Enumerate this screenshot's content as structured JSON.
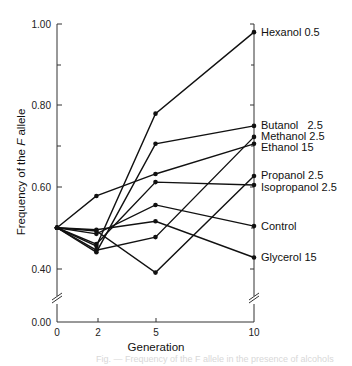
{
  "chart_data": {
    "type": "line",
    "title": "",
    "xlabel": "Generation",
    "ylabel": "Frequency of the F allele",
    "ylabel_parts": {
      "pre": "Frequency of the ",
      "italic": "F",
      "post": " allele"
    },
    "x": [
      0,
      2,
      5,
      10
    ],
    "x_tick_labels": [
      "0",
      "2",
      "5",
      "10"
    ],
    "y_tick_labels": [
      "0.00",
      "0.40",
      "0.60",
      "0.80",
      "1.00"
    ],
    "y_ticks": [
      0.0,
      0.4,
      0.5,
      0.6,
      0.7,
      0.8,
      0.9,
      1.0
    ],
    "ylim": [
      0.0,
      1.0
    ],
    "axis_break": true,
    "grid": false,
    "legend_position": "right (direct labels at line ends)",
    "series": [
      {
        "name": "Hexanol 0.5",
        "values": [
          0.5,
          0.455,
          0.78,
          0.98
        ]
      },
      {
        "name": "Butanol 2.5",
        "values": [
          0.5,
          0.44,
          0.706,
          0.75
        ]
      },
      {
        "name": "Methanol 2.5",
        "values": [
          0.5,
          0.445,
          0.477,
          0.723
        ]
      },
      {
        "name": "Ethanol 15",
        "values": [
          0.5,
          0.578,
          0.632,
          0.706
        ]
      },
      {
        "name": "Propanol 2.5",
        "values": [
          0.5,
          0.492,
          0.39,
          0.627
        ]
      },
      {
        "name": "Isopropanol 2.5",
        "values": [
          0.5,
          0.46,
          0.612,
          0.605
        ]
      },
      {
        "name": "Control",
        "values": [
          0.5,
          0.485,
          0.556,
          0.504
        ]
      },
      {
        "name": "Glycerol 15",
        "values": [
          0.5,
          0.495,
          0.516,
          0.427
        ]
      }
    ]
  },
  "labels": {
    "hexanol": "Hexanol 0.5",
    "butanol": "Butanol   2.5",
    "methanol": "Methanol 2.5",
    "ethanol": "Ethanol 15",
    "propanol": "Propanol 2.5",
    "isopropanol": "Isopropanol 2.5",
    "control": "Control",
    "glycerol": "Glycerol 15"
  },
  "caption": "Fig. — Frequency of the F allele in the presence of alcohols"
}
